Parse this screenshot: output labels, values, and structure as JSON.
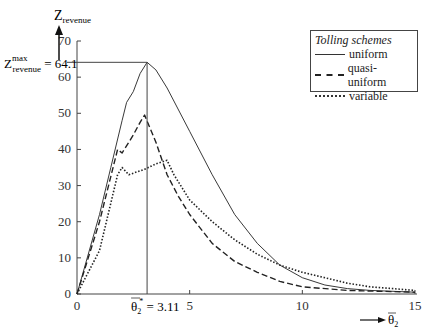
{
  "chart_data": {
    "type": "line",
    "title": "",
    "xlabel": "θ̄2",
    "ylabel": "Z_revenue",
    "xlim": [
      0,
      15
    ],
    "ylim": [
      0,
      70
    ],
    "x_ticks": [
      0,
      5,
      10,
      15
    ],
    "y_ticks": [
      0,
      10,
      20,
      30,
      40,
      50,
      60,
      70
    ],
    "grid": false,
    "legend_position": "top-right",
    "legend_title": "Tolling schemes",
    "series": [
      {
        "name": "uniform",
        "style": "solid",
        "points": [
          [
            0,
            0
          ],
          [
            1,
            22
          ],
          [
            1.5,
            35
          ],
          [
            2,
            48
          ],
          [
            2.2,
            53
          ],
          [
            2.5,
            56
          ],
          [
            2.8,
            61
          ],
          [
            3.11,
            64.1
          ],
          [
            3.5,
            62
          ],
          [
            4,
            57
          ],
          [
            5,
            45
          ],
          [
            6,
            33
          ],
          [
            7,
            22
          ],
          [
            8,
            14
          ],
          [
            9,
            8
          ],
          [
            10,
            4.5
          ],
          [
            11,
            2.5
          ],
          [
            12,
            1.5
          ],
          [
            13,
            1
          ],
          [
            15,
            0.5
          ]
        ]
      },
      {
        "name": "quasi-uniform",
        "style": "dashed",
        "points": [
          [
            0,
            0
          ],
          [
            1,
            20
          ],
          [
            1.8,
            40
          ],
          [
            2,
            39
          ],
          [
            2.5,
            44
          ],
          [
            2.8,
            47.5
          ],
          [
            3,
            49.5
          ],
          [
            3.5,
            42
          ],
          [
            4,
            33
          ],
          [
            4.5,
            27
          ],
          [
            5,
            22
          ],
          [
            6,
            14
          ],
          [
            7,
            9
          ],
          [
            8,
            6
          ],
          [
            9,
            3.5
          ],
          [
            10,
            2
          ],
          [
            12,
            1
          ],
          [
            15,
            0.5
          ]
        ]
      },
      {
        "name": "variable",
        "style": "dotted",
        "points": [
          [
            0,
            0
          ],
          [
            1,
            12
          ],
          [
            1.8,
            33
          ],
          [
            2,
            35
          ],
          [
            2.3,
            33
          ],
          [
            3,
            34.5
          ],
          [
            3.5,
            36
          ],
          [
            4,
            37
          ],
          [
            4.3,
            33
          ],
          [
            5,
            26
          ],
          [
            6,
            20
          ],
          [
            7,
            15
          ],
          [
            8,
            11
          ],
          [
            9,
            8
          ],
          [
            10,
            6
          ],
          [
            11,
            4.5
          ],
          [
            12,
            3
          ],
          [
            13,
            2
          ],
          [
            15,
            1
          ]
        ]
      }
    ],
    "annotations": [
      {
        "text": "Z_revenue^max = 64.1",
        "x": 0,
        "y": 64.1
      },
      {
        "text": "θ̄2* = 3.11",
        "x": 3.11,
        "y": 0
      }
    ]
  },
  "labels": {
    "y_axis": "Z",
    "y_axis_sub": "revenue",
    "x_axis": "θ",
    "x_axis_sub": "2",
    "zmax_main": "Z",
    "zmax_sup": "max",
    "zmax_sub": "revenue",
    "zmax_value": "= 64.1",
    "theta_star_main": "θ",
    "theta_star_sub": "2",
    "theta_star_sup": "*",
    "theta_star_value": "= 3.11",
    "x_origin": "0",
    "y_origin": "0"
  },
  "legend": {
    "title": "Tolling schemes",
    "items": [
      {
        "label": "uniform"
      },
      {
        "label": "quasi-uniform"
      },
      {
        "label": "variable"
      }
    ]
  }
}
